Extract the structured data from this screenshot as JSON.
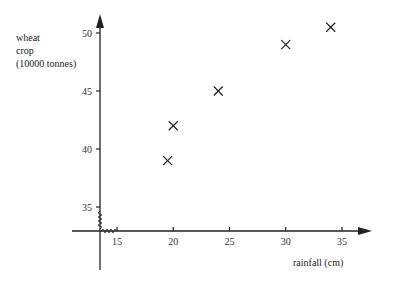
{
  "chart_data": {
    "type": "scatter",
    "title": "",
    "xlabel": "rainfall (cm)",
    "ylabel": "wheat crop (10000 tonnes)",
    "ylabel_lines": [
      "wheat",
      "crop",
      "(10000 tonnes)"
    ],
    "x_ticks": [
      15,
      20,
      25,
      30,
      35
    ],
    "y_ticks": [
      35,
      40,
      45,
      50
    ],
    "xlim": [
      13.5,
      37
    ],
    "ylim": [
      33,
      52
    ],
    "axis_breaks": true,
    "grid": false,
    "marker": "x",
    "points": [
      {
        "x": 19.5,
        "y": 39
      },
      {
        "x": 20,
        "y": 42
      },
      {
        "x": 24,
        "y": 45
      },
      {
        "x": 30,
        "y": 49
      },
      {
        "x": 34,
        "y": 50.5
      }
    ]
  }
}
